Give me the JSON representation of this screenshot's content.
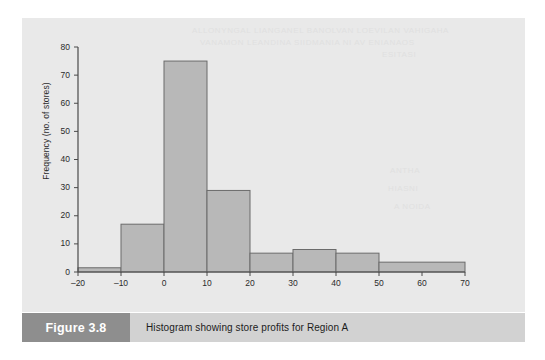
{
  "figure": {
    "number_label": "Figure 3.8",
    "caption": "Histogram showing store profits for Region A"
  },
  "colors": {
    "page_background": "#ffffff",
    "panel_background": "#e9e9e9",
    "bar_fill": "#b8b8b8",
    "bar_stroke": "#6b6b6b",
    "axis_line": "#4a4a4a",
    "tick_text": "#2b2b2b",
    "caption_bar": "#d2d2d2",
    "figure_number_box": "#8e8e8e",
    "figure_number_text": "#ffffff"
  },
  "artifacts": {
    "bleed_line_1": "ALLONYNGAL LIANGANEL BANOLVAN LOEVILAN VAHIGAHA",
    "bleed_line_2": "VANAMON LEANDINA  SIIDMANIA   NI AV ENIANAOS",
    "bleed_line_3": "ESITASI",
    "bleed_line_4": "ANTHA",
    "bleed_line_5": "HIASNI",
    "bleed_line_6": "A NOIDA"
  },
  "chart_data": {
    "type": "bar",
    "subtype": "histogram",
    "title": "",
    "xlabel": "",
    "ylabel": "Frequency (no. of stores)",
    "xlim": [
      -20,
      70
    ],
    "ylim": [
      0,
      80
    ],
    "xticks": [
      -20,
      -10,
      0,
      10,
      20,
      30,
      40,
      50,
      60,
      70
    ],
    "xtick_labels": [
      "–20",
      "–10",
      "0",
      "10",
      "20",
      "30",
      "40",
      "50",
      "60",
      "70"
    ],
    "yticks": [
      0,
      10,
      20,
      30,
      40,
      50,
      60,
      70,
      80
    ],
    "ytick_labels": [
      "0",
      "10",
      "20",
      "30",
      "40",
      "50",
      "60",
      "70",
      "80"
    ],
    "grid": false,
    "legend": false,
    "bin_width": 10,
    "bins": [
      {
        "label": "−20 to −10",
        "x0": -20,
        "x1": -10,
        "value": 1.5
      },
      {
        "label": "−10 to 0",
        "x0": -10,
        "x1": 0,
        "value": 17
      },
      {
        "label": "0 to 10",
        "x0": 0,
        "x1": 10,
        "value": 75
      },
      {
        "label": "10 to 20",
        "x0": 10,
        "x1": 20,
        "value": 29
      },
      {
        "label": "20 to 30",
        "x0": 20,
        "x1": 30,
        "value": 6.7
      },
      {
        "label": "30 to 40",
        "x0": 30,
        "x1": 40,
        "value": 8
      },
      {
        "label": "40 to 50",
        "x0": 40,
        "x1": 50,
        "value": 6.7
      },
      {
        "label": "50 to 70",
        "x0": 50,
        "x1": 70,
        "value": 3.5
      }
    ]
  }
}
